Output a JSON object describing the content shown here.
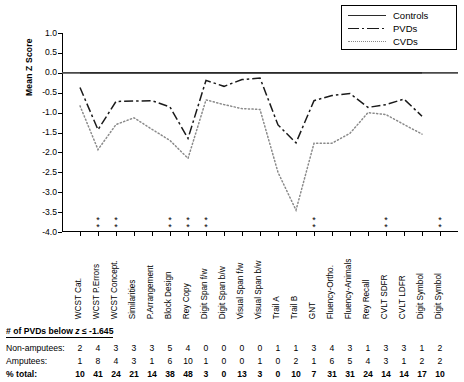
{
  "chart_data": {
    "type": "line",
    "title": "",
    "xlabel": "",
    "ylabel": "Mean Z Score",
    "ylim": [
      -4.0,
      1.0
    ],
    "yticks": [
      "1.0",
      "0.5",
      "0.0",
      "-0.5",
      "-1.0",
      "-1.5",
      "-2.0",
      "-2.5",
      "-3.0",
      "-3.5",
      "-4.0"
    ],
    "grid": false,
    "legend_position": "top-right",
    "categories": [
      "WCST Cat.",
      "WCST P.Errors",
      "WCST Concept.",
      "Similarities",
      "P.Arrangement",
      "Block Design",
      "Rey Copy",
      "Digit Span f/w",
      "Digit Span b/w",
      "Visual Span f/w",
      "Visual Span b/w",
      "Trail A",
      "Trail B",
      "GNT",
      "Fluency-Ortho.",
      "Fluency-Animals",
      "Rey Recall",
      "CVLT SDFR",
      "CVLT LDFR",
      "Digit Symbol"
    ],
    "series": [
      {
        "name": "Controls",
        "style": "solid",
        "color": "#2b2b2b",
        "values": [
          0.0,
          0.0,
          0.0,
          0.0,
          0.0,
          0.0,
          0.0,
          0.0,
          0.0,
          0.0,
          0.0,
          0.0,
          0.0,
          0.0,
          0.0,
          0.0,
          0.0,
          0.0,
          0.0,
          0.0
        ]
      },
      {
        "name": "PVDs",
        "style": "dash-dot",
        "color": "#1a1a1a",
        "values": [
          -0.37,
          -1.43,
          -0.72,
          -0.71,
          -0.7,
          -0.86,
          -1.65,
          -0.19,
          -0.34,
          -0.17,
          -0.13,
          -1.31,
          -1.76,
          -0.7,
          -0.57,
          -0.52,
          -0.87,
          -0.8,
          -0.66,
          -1.09
        ]
      },
      {
        "name": "CVDs",
        "style": "dotted",
        "color": "#8a8a8a",
        "values": [
          -0.83,
          -1.93,
          -1.3,
          -1.13,
          -1.42,
          -1.7,
          -2.15,
          -0.68,
          -0.8,
          -0.9,
          -0.92,
          -2.5,
          -3.45,
          -1.77,
          -1.77,
          -1.52,
          -1.0,
          -1.05,
          -1.3,
          -1.54
        ]
      }
    ],
    "significance_marker": "*",
    "significance_columns": [
      2,
      3,
      6,
      7,
      8,
      14,
      18,
      21
    ]
  },
  "legend": {
    "entries": [
      {
        "label": "Controls",
        "key": "solid-line-key"
      },
      {
        "label": "PVDs",
        "key": "dashdot-line-key"
      },
      {
        "label": "CVDs",
        "key": "dotted-line-key"
      }
    ]
  },
  "table": {
    "header_prefix": "# of PVDs below ",
    "header_italic": "z",
    "header_suffix": " ≤ -1.645",
    "rows": [
      {
        "label": "Non-amputees:",
        "bold": false,
        "values": [
          "2",
          "4",
          "3",
          "3",
          "3",
          "5",
          "4",
          "0",
          "0",
          "0",
          "0",
          "1",
          "1",
          "3",
          "4",
          "3",
          "1",
          "3",
          "3",
          "1",
          "2",
          "2"
        ]
      },
      {
        "label": "Amputees:",
        "bold": false,
        "values": [
          "1",
          "8",
          "4",
          "3",
          "1",
          "6",
          "10",
          "1",
          "0",
          "0",
          "1",
          "0",
          "2",
          "1",
          "6",
          "5",
          "4",
          "3",
          "1",
          "2",
          "2",
          "2",
          "3"
        ]
      },
      {
        "label": "% total:",
        "bold": true,
        "values": [
          "10",
          "41",
          "24",
          "21",
          "14",
          "38",
          "48",
          "3",
          "0",
          "13",
          "3",
          "0",
          "10",
          "7",
          "31",
          "31",
          "24",
          "14",
          "14",
          "17",
          "10",
          "14",
          "17"
        ]
      }
    ]
  }
}
